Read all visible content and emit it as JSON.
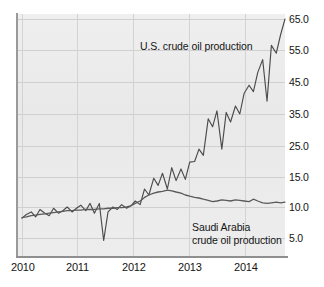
{
  "chart_data": {
    "type": "line",
    "title": "",
    "xlabel": "",
    "ylabel": "",
    "grid": true,
    "legend_position": "inline-annotations",
    "y_axis": {
      "ticks": [
        "5.0",
        "10.0",
        "15.0",
        "25.0",
        "35.0",
        "45.0",
        "55.0",
        "65.0"
      ],
      "values": [
        5.0,
        10.0,
        15.0,
        25.0,
        35.0,
        45.0,
        55.0,
        65.0
      ],
      "note": "non-linear / compressed spacing below 15.0",
      "ylim": [
        5.0,
        65.0
      ]
    },
    "x_axis": {
      "ticks": [
        "2010",
        "2011",
        "2012",
        "2013",
        "2014"
      ],
      "values": [
        2010,
        2011,
        2012,
        2013,
        2014
      ],
      "xlim": [
        2010.0,
        2014.83
      ]
    },
    "series": [
      {
        "name": "U.S. crude oil production",
        "annotation": "U.S. crude oil production",
        "color": "#4c4c4c",
        "x": [
          2010.0,
          2010.08,
          2010.17,
          2010.25,
          2010.33,
          2010.42,
          2010.5,
          2010.58,
          2010.67,
          2010.75,
          2010.83,
          2010.92,
          2011.0,
          2011.08,
          2011.17,
          2011.25,
          2011.33,
          2011.42,
          2011.5,
          2011.58,
          2011.67,
          2011.75,
          2011.83,
          2011.92,
          2012.0,
          2012.08,
          2012.17,
          2012.25,
          2012.33,
          2012.42,
          2012.5,
          2012.58,
          2012.67,
          2012.75,
          2012.83,
          2012.92,
          2013.0,
          2013.08,
          2013.17,
          2013.25,
          2013.33,
          2013.42,
          2013.5,
          2013.58,
          2013.67,
          2013.75,
          2013.83,
          2013.92,
          2014.0,
          2014.08,
          2014.17,
          2014.25,
          2014.33,
          2014.42,
          2014.5,
          2014.58,
          2014.67,
          2014.75,
          2014.83
        ],
        "values": [
          8.2,
          8.8,
          9.2,
          8.4,
          9.6,
          9.0,
          8.6,
          9.8,
          9.0,
          9.4,
          10.0,
          9.2,
          9.8,
          10.3,
          9.4,
          10.6,
          9.0,
          10.6,
          4.6,
          9.2,
          10.0,
          9.6,
          10.4,
          9.8,
          10.2,
          11.0,
          10.4,
          13.0,
          12.0,
          14.8,
          13.6,
          16.2,
          13.0,
          18.0,
          14.4,
          17.6,
          14.6,
          19.8,
          20.0,
          24.0,
          22.0,
          33.5,
          31.0,
          36.0,
          24.0,
          35.5,
          32.5,
          37.5,
          35.0,
          41.5,
          44.0,
          42.0,
          48.0,
          52.0,
          39.0,
          56.5,
          54.0,
          60.0,
          65.0
        ]
      },
      {
        "name": "Saudi Arabia crude oil production",
        "annotation_line1": "Saudi Arabia",
        "annotation_line2": "crude oil production",
        "color": "#5a5a5a",
        "x": [
          2010.0,
          2010.08,
          2010.17,
          2010.25,
          2010.33,
          2010.42,
          2010.5,
          2010.58,
          2010.67,
          2010.75,
          2010.83,
          2010.92,
          2011.0,
          2011.08,
          2011.17,
          2011.25,
          2011.33,
          2011.42,
          2011.5,
          2011.58,
          2011.67,
          2011.75,
          2011.83,
          2011.92,
          2012.0,
          2012.08,
          2012.17,
          2012.25,
          2012.33,
          2012.42,
          2012.5,
          2012.58,
          2012.67,
          2012.75,
          2012.83,
          2012.92,
          2013.0,
          2013.08,
          2013.17,
          2013.25,
          2013.33,
          2013.42,
          2013.5,
          2013.58,
          2013.67,
          2013.75,
          2013.83,
          2013.92,
          2014.0,
          2014.08,
          2014.17,
          2014.25,
          2014.33,
          2014.42,
          2014.5,
          2014.58,
          2014.67,
          2014.75,
          2014.83
        ],
        "values": [
          8.3,
          8.4,
          8.6,
          8.7,
          8.8,
          8.9,
          9.0,
          9.1,
          9.2,
          9.3,
          9.4,
          9.4,
          9.5,
          9.5,
          9.6,
          9.6,
          9.6,
          9.7,
          9.7,
          9.8,
          9.8,
          9.9,
          9.9,
          10.0,
          10.2,
          10.6,
          11.0,
          11.6,
          12.0,
          12.3,
          12.5,
          12.6,
          12.8,
          12.7,
          12.5,
          12.3,
          12.0,
          11.8,
          11.6,
          11.5,
          11.3,
          11.1,
          10.9,
          11.0,
          11.2,
          11.1,
          11.0,
          11.2,
          11.1,
          11.0,
          10.9,
          11.3,
          11.0,
          10.7,
          10.6,
          10.7,
          10.8,
          10.7,
          10.8
        ]
      }
    ]
  },
  "axis": {
    "y_labels": [
      "65.0",
      "55.0",
      "45.0",
      "35.0",
      "25.0",
      "15.0",
      "10.0",
      "5.0"
    ],
    "x_labels": [
      "2010",
      "2011",
      "2012",
      "2013",
      "2014"
    ]
  },
  "annotations": {
    "us": "U.S. crude oil production",
    "saudi_line1": "Saudi Arabia",
    "saudi_line2": "crude oil production"
  },
  "colors": {
    "panel_background": "#ececec",
    "gridline": "#cfcfcf",
    "axis": "#9a9a9a",
    "us_line": "#4c4c4c",
    "saudi_line": "#5a5a5a",
    "text": "#141414"
  }
}
